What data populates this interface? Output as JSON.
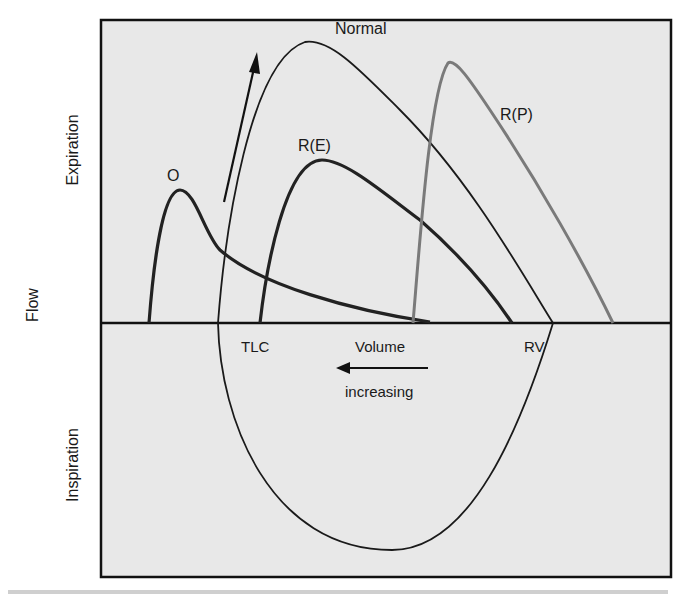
{
  "figure": {
    "axis": {
      "y_title": "Flow",
      "upper_region": "Expiration",
      "lower_region": "Inspiration"
    },
    "annotations": {
      "tlc": "TLC",
      "volume": "Volume",
      "rv": "RV",
      "increasing": "increasing"
    },
    "curves": [
      {
        "id": "normal",
        "label": "Normal",
        "color": "#1a1a1a"
      },
      {
        "id": "obstructive",
        "label": "O",
        "color": "#1a1a1a"
      },
      {
        "id": "restrictive-extraparenchymal",
        "label": "R(E)",
        "color": "#1a1a1a"
      },
      {
        "id": "restrictive-parenchymal",
        "label": "R(P)",
        "color": "#7a7a7a"
      }
    ],
    "colors": {
      "background": "#e9e9e9",
      "frame": "#111111"
    }
  }
}
